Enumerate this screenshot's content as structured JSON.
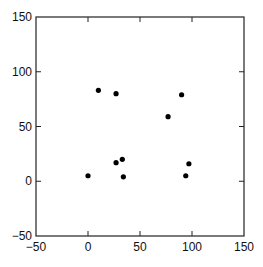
{
  "chart_data": {
    "type": "scatter",
    "title": "",
    "xlabel": "",
    "ylabel": "",
    "xlim": [
      -50,
      150
    ],
    "ylim": [
      -50,
      150
    ],
    "xticks": [
      -50,
      0,
      50,
      100,
      150
    ],
    "yticks": [
      -50,
      0,
      50,
      100,
      150
    ],
    "xtick_labels": [
      "−50",
      "0",
      "50",
      "100",
      "150"
    ],
    "ytick_labels": [
      "−50",
      "0",
      "50",
      "100",
      "150"
    ],
    "grid": false,
    "legend": null,
    "marker_color": "#000000",
    "series": [
      {
        "name": "points",
        "points": [
          {
            "x": 10,
            "y": 83
          },
          {
            "x": 27,
            "y": 80
          },
          {
            "x": 90,
            "y": 79
          },
          {
            "x": 77,
            "y": 59
          },
          {
            "x": 27,
            "y": 17
          },
          {
            "x": 33,
            "y": 20
          },
          {
            "x": 34,
            "y": 4
          },
          {
            "x": 0,
            "y": 5
          },
          {
            "x": 97,
            "y": 16
          },
          {
            "x": 94,
            "y": 5
          }
        ]
      }
    ]
  }
}
